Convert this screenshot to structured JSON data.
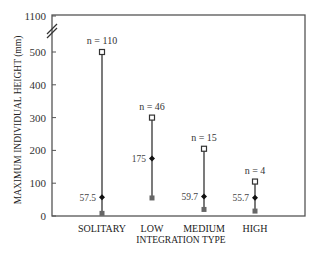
{
  "chart_data": {
    "type": "range-dot",
    "title": "",
    "xlabel": "INTEGRATION TYPE",
    "ylabel": "MAXIMUM INDIVIDUAL HEIGHT (mm)",
    "y_ticks": [
      0,
      100,
      200,
      300,
      400,
      500,
      1100
    ],
    "y_axis_break": "between 500 and 1100",
    "ylim": [
      0,
      1100
    ],
    "grid": false,
    "legend": null,
    "categories": [
      "SOLITARY",
      "LOW",
      "MEDIUM",
      "HIGH"
    ],
    "series": [
      {
        "name": "maximum",
        "marker": "open square",
        "values": [
          500,
          300,
          205,
          105
        ]
      },
      {
        "name": "mean",
        "marker": "filled diamond",
        "values": [
          57.5,
          175,
          59.7,
          55.7
        ]
      },
      {
        "name": "minimum",
        "marker": "filled square",
        "values": [
          8,
          55,
          20,
          15
        ]
      }
    ],
    "sample_sizes": [
      "n = 110",
      "n = 46",
      "n = 15",
      "n = 4"
    ],
    "mean_labels": [
      "57.5",
      "175",
      "59.7",
      "55.7"
    ]
  }
}
